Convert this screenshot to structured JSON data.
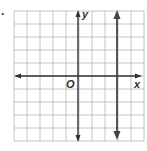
{
  "problem": {
    "number_label": "."
  },
  "graph": {
    "x_label": "x",
    "y_label": "y",
    "origin_label": "O",
    "grid": {
      "cols": 10,
      "rows": 10,
      "x_min": -5,
      "x_max": 5,
      "y_min": -5,
      "y_max": 5
    },
    "lines": [
      {
        "type": "vertical",
        "x": 3
      }
    ],
    "colors": {
      "grid": "#b5b5b5",
      "axis": "#333333",
      "line": "#444444"
    }
  }
}
